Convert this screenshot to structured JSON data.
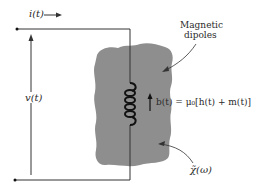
{
  "diagram": {
    "current_label": "i(t)",
    "voltage_label": "v(t)",
    "dipoles_label_line1": "Magnetic",
    "dipoles_label_line2": "dipoles",
    "field_equation": "b(t) = μ₀[h(t) + m(t)]",
    "susceptibility_label": "χ̃(ω)",
    "colors": {
      "material": "#8e8e8e",
      "wire": "#333333",
      "coil": "#111111",
      "text": "#2a2a2a"
    }
  }
}
